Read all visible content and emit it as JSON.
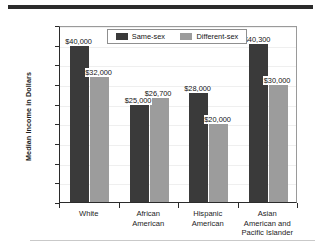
{
  "chart_data": {
    "type": "bar",
    "title": "",
    "xlabel": "",
    "ylabel": "Median Income in Dollars",
    "ylim": [
      0,
      45000
    ],
    "ytick_labels": [
      "45,000",
      "40,000",
      "35,000",
      "30,000",
      "25,000",
      "20,000",
      "15,000",
      "10,000",
      "5,000",
      "0"
    ],
    "ytick_values": [
      45000,
      40000,
      35000,
      30000,
      25000,
      20000,
      15000,
      10000,
      5000,
      0
    ],
    "grid": false,
    "legend_position": "top-center",
    "categories": [
      "White",
      "African American",
      "Hispanic American",
      "Asian American and Pacific Islander"
    ],
    "category_lines": [
      [
        "White"
      ],
      [
        "African",
        "American"
      ],
      [
        "Hispanic",
        "American"
      ],
      [
        "Asian",
        "American and",
        "Pacific Islander"
      ]
    ],
    "series": [
      {
        "name": "Same-sex",
        "color": "#3a3a3a",
        "values": [
          40000,
          25000,
          28000,
          40300
        ],
        "labels": [
          "$40,000",
          "$25,000",
          "$28,000",
          "$40,300"
        ]
      },
      {
        "name": "Different-sex",
        "color": "#9c9c9c",
        "values": [
          32000,
          26700,
          20000,
          30000
        ],
        "labels": [
          "$32,000",
          "$26,700",
          "$20,000",
          "$30,000"
        ]
      }
    ]
  },
  "legend": {
    "entries": [
      {
        "label": "Same-sex",
        "color": "#3a3a3a"
      },
      {
        "label": "Different-sex",
        "color": "#9c9c9c"
      }
    ]
  }
}
